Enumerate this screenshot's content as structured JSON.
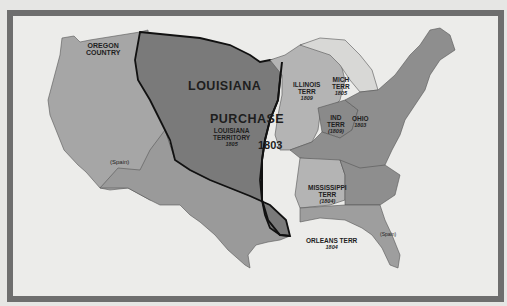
{
  "map": {
    "title": "Louisiana Purchase 1803",
    "colors": {
      "background": "#e6e6e4",
      "frame": "#6e6e6e",
      "sea": "#ececea",
      "us_states": "#8e8e8e",
      "purchase": "#7a7a7a",
      "territories_light": "#b4b4b4",
      "oregon_spain": "#a6a6a6",
      "boundary": "#111111"
    },
    "labels": {
      "oregon": [
        "OREGON",
        "COUNTRY"
      ],
      "louisiana": "LOUISIANA",
      "purchase": "PURCHASE",
      "louisiana_territory": [
        "LOUISIANA",
        "TERRITORY",
        "1805"
      ],
      "purchase_year": "1803",
      "illinois": [
        "ILLINOIS",
        "TERR",
        "1809"
      ],
      "michigan": [
        "MICH",
        "TERR",
        "1805"
      ],
      "indiana": [
        "IND",
        "TERR",
        "(1809)"
      ],
      "ohio": [
        "OHIO",
        "1803"
      ],
      "mississippi": [
        "MISSISSIPPI",
        "TERR",
        "(1804)"
      ],
      "orleans": [
        "ORLEANS TERR",
        "1804"
      ],
      "spain_west": "(Spain)",
      "spain_florida": "(Spain)"
    }
  }
}
